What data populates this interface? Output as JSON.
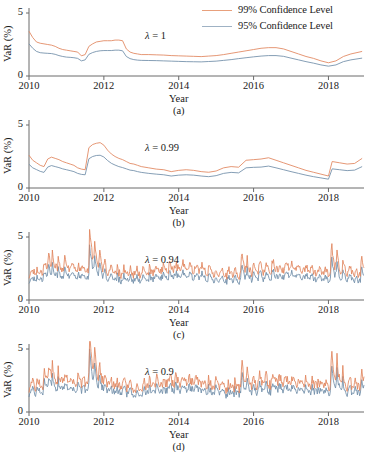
{
  "figure": {
    "width": 378,
    "height": 450,
    "background": "#ffffff"
  },
  "legend": {
    "position": "top-right",
    "entries": [
      {
        "label": "99% Confidence Level",
        "color": "#e8a07c",
        "name": "legend-99"
      },
      {
        "label": "95% Confidence Level",
        "color": "#9fb2c4",
        "name": "legend-95"
      }
    ]
  },
  "colors": {
    "series_99": "#e0845c",
    "series_95": "#6f8ca8",
    "axis": "#6b6b6b",
    "text": "#1a1a1a"
  },
  "axes": {
    "ylabel": "VaR (%)",
    "xlabel": "Year",
    "yticks": [
      "0",
      "5"
    ],
    "ylim": [
      0,
      5
    ],
    "xticks": [
      "2010",
      "2012",
      "2014",
      "2016",
      "2018"
    ],
    "xlim": [
      2010,
      2018.95
    ],
    "grid": false
  },
  "chart_data": {
    "type": "line",
    "title": "",
    "xlabel": "Year",
    "ylabel": "VaR (%)",
    "ylim": [
      0,
      5
    ],
    "xlim": [
      2010,
      2018.95
    ],
    "grid": false,
    "legend_position": "top-right",
    "panels": [
      {
        "id": "a",
        "caption": "(a)",
        "annotation": "λ = 1",
        "annotation_lambda": "λ",
        "annotation_value": "1",
        "x": [
          2010.0,
          2010.1,
          2010.2,
          2010.3,
          2010.4,
          2010.5,
          2010.6,
          2010.7,
          2010.8,
          2010.9,
          2011.0,
          2011.1,
          2011.2,
          2011.3,
          2011.4,
          2011.5,
          2011.6,
          2011.7,
          2011.8,
          2011.9,
          2012.0,
          2012.1,
          2012.2,
          2012.3,
          2012.4,
          2012.5,
          2012.6,
          2012.7,
          2012.8,
          2012.9,
          2013.0,
          2013.2,
          2013.4,
          2013.6,
          2013.8,
          2014.0,
          2014.2,
          2014.4,
          2014.6,
          2014.8,
          2015.0,
          2015.2,
          2015.4,
          2015.6,
          2015.8,
          2016.0,
          2016.2,
          2016.4,
          2016.6,
          2016.8,
          2017.0,
          2017.2,
          2017.4,
          2017.6,
          2017.8,
          2018.0,
          2018.2,
          2018.4,
          2018.6,
          2018.9
        ],
        "series": [
          {
            "name": "99% Confidence Level",
            "color": "#e0845c",
            "values": [
              3.55,
              3.05,
              2.7,
              2.6,
              2.55,
              2.5,
              2.45,
              2.35,
              2.2,
              2.1,
              2.05,
              2.0,
              1.95,
              1.9,
              1.6,
              1.7,
              2.35,
              2.55,
              2.7,
              2.75,
              2.8,
              2.8,
              2.8,
              2.85,
              2.85,
              2.8,
              2.15,
              1.9,
              1.8,
              1.75,
              1.7,
              1.7,
              1.68,
              1.66,
              1.62,
              1.6,
              1.58,
              1.56,
              1.54,
              1.58,
              1.62,
              1.7,
              1.8,
              1.9,
              2.0,
              2.1,
              2.2,
              2.25,
              2.25,
              2.15,
              1.95,
              1.75,
              1.55,
              1.4,
              1.2,
              1.05,
              1.2,
              1.55,
              1.75,
              1.95
            ]
          },
          {
            "name": "95% Confidence Level",
            "color": "#6f8ca8",
            "values": [
              2.55,
              2.2,
              1.95,
              1.85,
              1.82,
              1.8,
              1.78,
              1.72,
              1.62,
              1.55,
              1.5,
              1.48,
              1.45,
              1.4,
              1.2,
              1.28,
              1.72,
              1.86,
              1.95,
              2.0,
              2.02,
              2.02,
              2.02,
              2.05,
              2.05,
              2.0,
              1.55,
              1.38,
              1.3,
              1.26,
              1.24,
              1.23,
              1.22,
              1.2,
              1.18,
              1.16,
              1.14,
              1.13,
              1.12,
              1.15,
              1.18,
              1.24,
              1.3,
              1.38,
              1.45,
              1.52,
              1.58,
              1.62,
              1.62,
              1.56,
              1.42,
              1.28,
              1.14,
              1.02,
              0.88,
              0.78,
              0.88,
              1.14,
              1.28,
              1.42
            ]
          }
        ]
      },
      {
        "id": "b",
        "caption": "(b)",
        "annotation": "λ = 0.99",
        "annotation_lambda": "λ",
        "annotation_value": "0.99",
        "x": [
          2010.0,
          2010.1,
          2010.2,
          2010.3,
          2010.4,
          2010.5,
          2010.6,
          2010.7,
          2010.8,
          2010.9,
          2011.0,
          2011.1,
          2011.2,
          2011.3,
          2011.4,
          2011.5,
          2011.6,
          2011.7,
          2011.8,
          2011.9,
          2012.0,
          2012.1,
          2012.2,
          2012.3,
          2012.4,
          2012.5,
          2012.6,
          2012.7,
          2012.8,
          2012.9,
          2013.0,
          2013.2,
          2013.4,
          2013.6,
          2013.8,
          2014.0,
          2014.2,
          2014.4,
          2014.6,
          2014.8,
          2015.0,
          2015.2,
          2015.4,
          2015.6,
          2015.8,
          2016.0,
          2016.2,
          2016.4,
          2016.6,
          2016.8,
          2017.0,
          2017.2,
          2017.4,
          2017.6,
          2017.8,
          2018.0,
          2018.1,
          2018.3,
          2018.5,
          2018.7,
          2018.9
        ],
        "series": [
          {
            "name": "99% Confidence Level",
            "color": "#e0845c",
            "values": [
              2.6,
              2.2,
              2.0,
              1.8,
              1.7,
              2.3,
              2.45,
              2.35,
              2.25,
              2.1,
              2.0,
              1.9,
              1.8,
              1.6,
              1.5,
              1.45,
              3.2,
              3.45,
              3.55,
              3.6,
              3.4,
              3.0,
              2.7,
              2.5,
              2.35,
              2.25,
              2.1,
              1.95,
              1.9,
              1.8,
              1.7,
              1.6,
              1.5,
              1.45,
              1.3,
              1.4,
              1.45,
              1.4,
              1.3,
              1.25,
              1.35,
              1.6,
              1.7,
              1.65,
              2.2,
              2.25,
              2.3,
              2.4,
              2.2,
              2.0,
              1.8,
              1.6,
              1.4,
              1.25,
              1.1,
              0.95,
              2.1,
              2.0,
              1.9,
              1.95,
              2.35
            ]
          },
          {
            "name": "95% Confidence Level",
            "color": "#6f8ca8",
            "values": [
              1.88,
              1.6,
              1.46,
              1.32,
              1.24,
              1.66,
              1.78,
              1.7,
              1.62,
              1.52,
              1.45,
              1.38,
              1.3,
              1.16,
              1.08,
              1.05,
              2.32,
              2.5,
              2.58,
              2.6,
              2.46,
              2.18,
              1.96,
              1.82,
              1.7,
              1.62,
              1.52,
              1.42,
              1.38,
              1.3,
              1.24,
              1.16,
              1.1,
              1.05,
              0.95,
              1.02,
              1.05,
              1.02,
              0.95,
              0.9,
              0.98,
              1.16,
              1.24,
              1.2,
              1.6,
              1.64,
              1.66,
              1.74,
              1.6,
              1.45,
              1.3,
              1.16,
              1.02,
              0.9,
              0.8,
              0.7,
              1.52,
              1.45,
              1.38,
              1.42,
              1.7
            ]
          }
        ]
      },
      {
        "id": "c",
        "caption": "(c)",
        "annotation": "λ = 0.94",
        "annotation_lambda": "λ",
        "annotation_value": "0.94",
        "volatility": "high",
        "peak_value": 5.9,
        "peak_year": 2011.62,
        "noise_seed": 17,
        "base_level": 1.3,
        "spike_amplitude": 1.0
      },
      {
        "id": "d",
        "caption": "(d)",
        "annotation": "λ = 0.9",
        "annotation_lambda": "λ",
        "annotation_value": "0.9",
        "volatility": "very-high",
        "peak_value": 6.6,
        "peak_year": 2011.62,
        "noise_seed": 29,
        "base_level": 1.25,
        "spike_amplitude": 1.25
      }
    ]
  }
}
